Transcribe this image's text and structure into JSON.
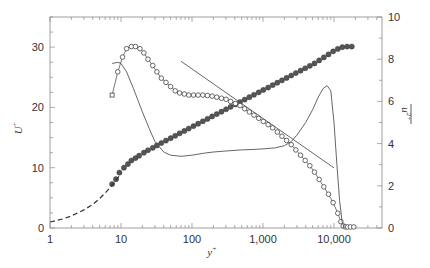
{
  "chart_data": {
    "type": "line",
    "title": "",
    "xlabel": "y+",
    "ylabel_left": "U+",
    "ylabel_right": "u'2+ (overbar)",
    "xscale": "log",
    "xlim": [
      1,
      48000
    ],
    "ylim_left": [
      0,
      35
    ],
    "ylim_right": [
      0,
      10
    ],
    "grid": false,
    "legend": "none",
    "x_ticks": [
      {
        "v": 1,
        "label": "1"
      },
      {
        "v": 10,
        "label": "10"
      },
      {
        "v": 100,
        "label": "100"
      },
      {
        "v": 1000,
        "label": "1,000"
      },
      {
        "v": 10000,
        "label": "10,000"
      }
    ],
    "y_left_ticks": [
      {
        "v": 0,
        "label": "0"
      },
      {
        "v": 10,
        "label": "10"
      },
      {
        "v": 20,
        "label": "20"
      },
      {
        "v": 30,
        "label": "30"
      }
    ],
    "y_right_ticks": [
      {
        "v": 0,
        "label": "0"
      },
      {
        "v": 2,
        "label": "2"
      },
      {
        "v": 4,
        "label": "4"
      },
      {
        "v": 6,
        "label": "6"
      },
      {
        "v": 8,
        "label": "8"
      },
      {
        "v": 10,
        "label": "10"
      }
    ],
    "series": [
      {
        "name": "U+ mean velocity (filled circles)",
        "axis": "left",
        "style": "filled-markers",
        "x": [
          7.5,
          8.5,
          9.5,
          11,
          12.5,
          14,
          16,
          18,
          21,
          24,
          28,
          32,
          37,
          43,
          50,
          58,
          67,
          78,
          90,
          105,
          122,
          142,
          165,
          192,
          223,
          260,
          302,
          350,
          408,
          475,
          552,
          642,
          747,
          870,
          1010,
          1180,
          1370,
          1590,
          1850,
          2150,
          2500,
          2900,
          3380,
          3930,
          4570,
          5310,
          6180,
          7190,
          8360,
          9720,
          11300,
          13100,
          15300,
          17800
        ],
        "values": [
          7.3,
          8.1,
          9.2,
          10.0,
          10.6,
          11.2,
          11.6,
          12.0,
          12.5,
          12.9,
          13.3,
          13.7,
          14.1,
          14.5,
          14.9,
          15.3,
          15.7,
          16.1,
          16.5,
          16.9,
          17.3,
          17.7,
          18.1,
          18.5,
          18.9,
          19.3,
          19.7,
          20.1,
          20.5,
          20.9,
          21.3,
          21.7,
          22.1,
          22.5,
          22.9,
          23.3,
          23.7,
          24.1,
          24.5,
          24.9,
          25.3,
          25.7,
          26.1,
          26.5,
          26.9,
          27.3,
          27.8,
          28.3,
          28.8,
          29.3,
          29.7,
          30.0,
          30.1,
          30.1
        ]
      },
      {
        "name": "Law of the wall (dashed)",
        "axis": "left",
        "style": "dashed",
        "x": [
          1,
          1.5,
          2,
          3,
          4,
          5,
          6,
          7,
          8,
          9,
          10
        ],
        "values": [
          1.0,
          1.5,
          2.0,
          3.0,
          3.9,
          4.9,
          5.8,
          6.7,
          7.5,
          8.3,
          9.0
        ]
      },
      {
        "name": "u'2+ turbulence intensity (open circles)",
        "axis": "right",
        "style": "open-markers-line",
        "x": [
          7.5,
          9,
          10.5,
          12,
          14,
          16,
          18.5,
          21,
          24,
          28,
          32,
          37,
          43,
          50,
          58,
          67,
          78,
          90,
          105,
          122,
          142,
          165,
          192,
          223,
          260,
          302,
          350,
          408,
          475,
          552,
          642,
          747,
          870,
          1010,
          1180,
          1370,
          1590,
          1850,
          2150,
          2500,
          2900,
          3380,
          3930,
          4570,
          5310,
          6180,
          7190,
          8360,
          9720,
          11300,
          12500,
          13500,
          14500,
          15500,
          17000,
          19000
        ],
        "values": [
          6.3,
          7.4,
          8.1,
          8.5,
          8.6,
          8.6,
          8.5,
          8.3,
          8.0,
          7.7,
          7.4,
          7.1,
          6.9,
          6.7,
          6.5,
          6.4,
          6.35,
          6.3,
          6.3,
          6.3,
          6.3,
          6.28,
          6.25,
          6.2,
          6.15,
          6.1,
          6.0,
          5.9,
          5.8,
          5.65,
          5.5,
          5.35,
          5.2,
          5.05,
          4.9,
          4.75,
          4.55,
          4.35,
          4.15,
          3.95,
          3.7,
          3.45,
          3.2,
          2.95,
          2.65,
          2.3,
          1.95,
          1.6,
          1.2,
          0.7,
          0.3,
          0.1,
          0.05,
          0.05,
          0.05,
          0.05
        ]
      },
      {
        "name": "DNS/model u'2+ (solid line)",
        "axis": "right",
        "style": "solid",
        "x": [
          7.5,
          9,
          10,
          12,
          15,
          20,
          25,
          30,
          40,
          50,
          70,
          100,
          150,
          200,
          300,
          500,
          700,
          1000,
          1500,
          2000,
          2500,
          3000,
          4000,
          5000,
          6000,
          7000,
          8000,
          9000,
          10000,
          11000,
          12000,
          13000,
          14000
        ],
        "values": [
          7.8,
          7.85,
          7.8,
          7.4,
          6.6,
          5.5,
          4.7,
          4.1,
          3.6,
          3.45,
          3.4,
          3.45,
          3.55,
          3.6,
          3.65,
          3.7,
          3.72,
          3.75,
          3.8,
          3.9,
          4.1,
          4.4,
          5.0,
          5.6,
          6.2,
          6.6,
          6.75,
          6.5,
          5.0,
          3.0,
          1.3,
          0.3,
          0.0
        ]
      },
      {
        "name": "Log slope reference line",
        "axis": "right",
        "style": "solid-thin",
        "x": [
          70,
          10000
        ],
        "values": [
          7.9,
          2.85
        ]
      }
    ]
  },
  "axes": {
    "x_title": "y",
    "x_title_sup": "+",
    "y_left_title": "U",
    "y_left_title_sup": "+",
    "y_right_title": "u",
    "y_right_title_sup": "2+"
  }
}
